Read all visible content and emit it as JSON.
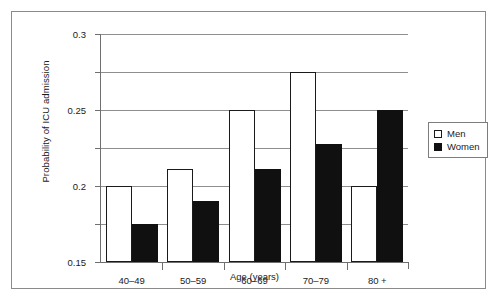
{
  "chart_data": {
    "type": "bar",
    "title": "",
    "xlabel": "Age (years)",
    "ylabel": "Probability of ICU admission",
    "categories": [
      "40–49",
      "50–59",
      "60–69",
      "70–79",
      "80 +"
    ],
    "series": [
      {
        "name": "Men",
        "color": "#ffffff",
        "values": [
          0.1,
          0.122,
          0.2,
          0.25,
          0.1
        ]
      },
      {
        "name": "Women",
        "color": "#101010",
        "values": [
          0.05,
          0.08,
          0.122,
          0.155,
          0.2
        ]
      }
    ],
    "ylim": [
      0,
      0.3
    ],
    "yticks": [
      0,
      0.05,
      0.1,
      0.15,
      0.2,
      0.25,
      0.3
    ],
    "ytick_labels": [
      "0",
      "0.05",
      "0.1",
      "0.15",
      "0.2",
      "0.25",
      "0.3"
    ],
    "grid": true,
    "legend_position": "right"
  },
  "legend": {
    "entries": [
      {
        "label": "Men"
      },
      {
        "label": "Women"
      }
    ]
  }
}
